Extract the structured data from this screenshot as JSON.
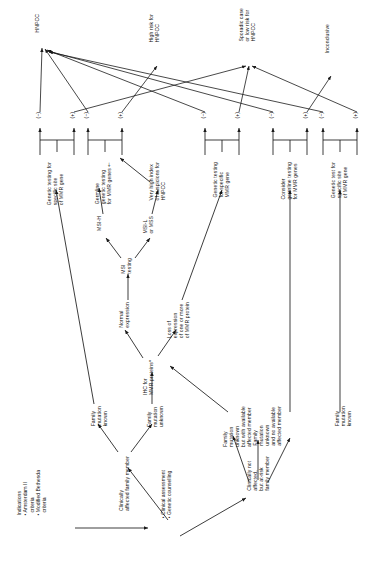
{
  "diagram": {
    "type": "flowchart",
    "orientation": "rotated-90-ccw",
    "background": "#ffffff",
    "line_color": "#1a1a1a"
  },
  "entry": {
    "indications_heading": "Indications",
    "indications_items": [
      "• Amsterdam II\n  criteria",
      "• Modified Bethesda\n  criteria"
    ],
    "indications_block": "Indications\n• Amsterdam II\n  criteria\n• Modified Bethesda\n  criteria",
    "assessment_block": "• Clinical assessment\n• Genetic counselling",
    "assessment_items": [
      "• Clinical assessment",
      "• Genetic counselling"
    ]
  },
  "branches": {
    "affected": "Clinically\naffected family member",
    "not_affected": "Clinically not\naffected,\nbut at-risk\nfamily member"
  },
  "family_status": [
    {
      "id": "fam-known-affected",
      "label": "Family\nmutation\nknown"
    },
    {
      "id": "fam-unknown-affected",
      "label": "Family\nmutation\nunknown"
    },
    {
      "id": "fam-unknown-available",
      "label": "Family\nmutation\nunknown\nbut with available\naffected member"
    },
    {
      "id": "fam-unknown-noavail",
      "label": "Family\nmutation\nunknown\nand no available\naffected member"
    },
    {
      "id": "fam-known-atrisk",
      "label": "Family\nmutation\nknown"
    }
  ],
  "screening": {
    "ihc": "IHC for\nMMR proteins*",
    "ihc_normal": "Normal\nexpression",
    "ihc_loss": "Loss of\nexpression\nof one or more\nof MMR protein",
    "msi": "MSI\ntesting",
    "msi_high": "MSI-H",
    "msi_low": "MSI-L\nor MSS",
    "very_high_index": "Very high index\nof suspicions for\nHNPCC"
  },
  "tests": [
    {
      "id": "test-1",
      "label": "Genetic testing for\nspecific site\nof MMR gene"
    },
    {
      "id": "test-2",
      "label": "Germline\ngenetic testing\nfor MMR genes†"
    },
    {
      "id": "test-3",
      "label": "Genetic testing\nfor specific\nMMR gene"
    },
    {
      "id": "test-4",
      "label": "Consider\ngermline testing\nfor MMR genes"
    },
    {
      "id": "test-5",
      "label": "Genetic test for\nspecific site\nof MMR gene"
    }
  ],
  "result_signs": {
    "positive": "(+)",
    "negative": "(−)",
    "order": [
      "(−)",
      "(+)",
      "(−)",
      "(+)",
      "(−)",
      "(+)",
      "(−)",
      "(+)",
      "(−)",
      "(+)"
    ]
  },
  "outcomes": [
    {
      "id": "outcome-hnpcc",
      "label": "HNPCC"
    },
    {
      "id": "outcome-high-risk",
      "label": "High risk for\nHNPCC"
    },
    {
      "id": "outcome-sporadic",
      "label": "Sporadic case\nor low risk for\nHNPCC"
    },
    {
      "id": "outcome-inconclusive",
      "label": "Inconclusive"
    }
  ]
}
